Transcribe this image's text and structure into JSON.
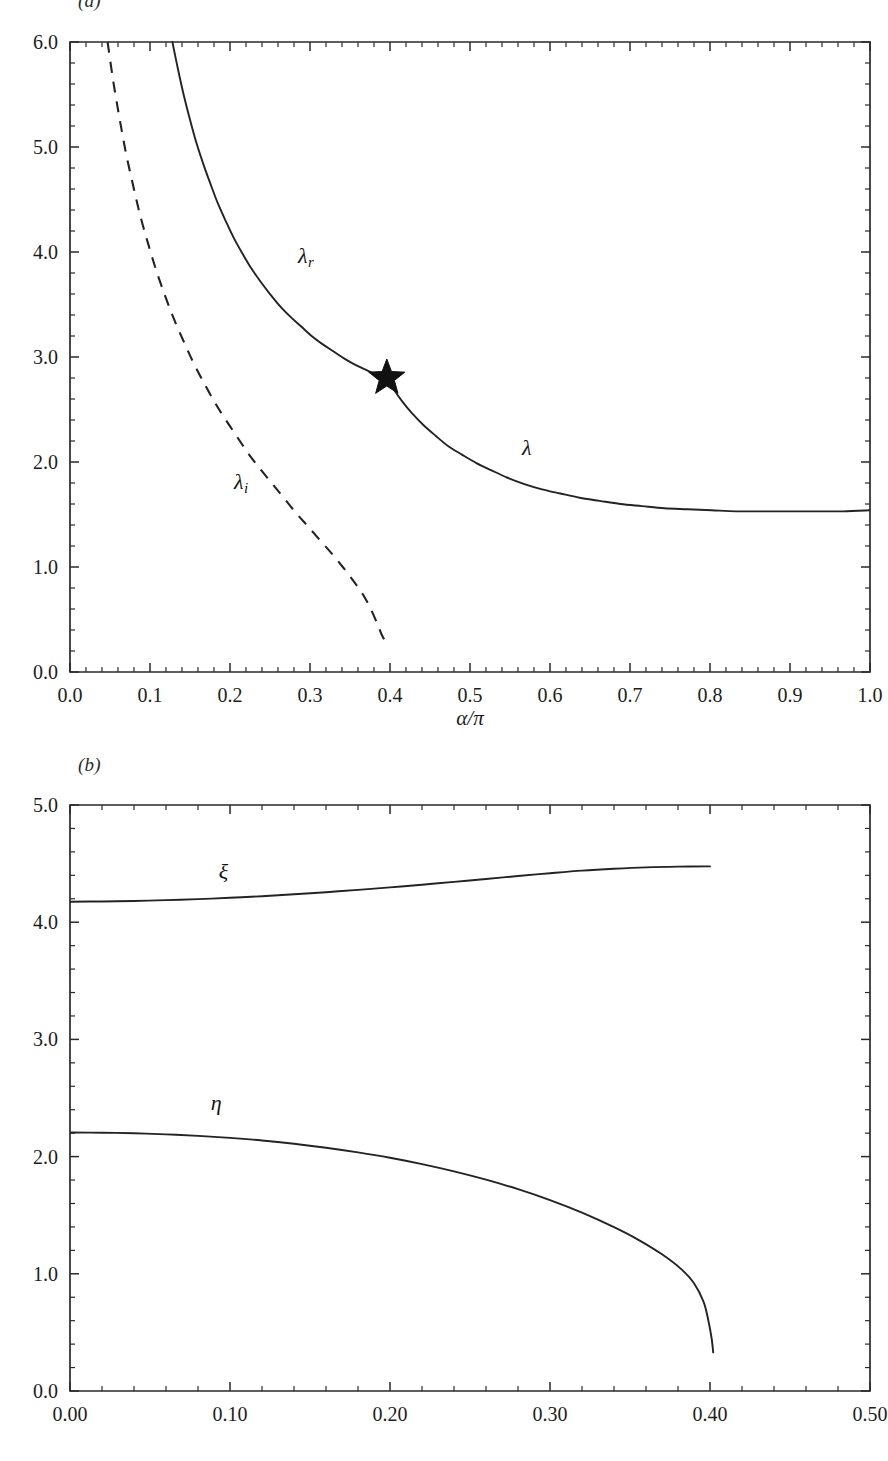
{
  "figure": {
    "panel_a_tag": "(a)",
    "panel_b_tag": "(b)"
  },
  "chart_data": [
    {
      "id": "panel-a",
      "type": "line",
      "title": "",
      "panel_label": "(a)",
      "xlabel": "α/π",
      "ylabel": "",
      "xlim": [
        0.0,
        1.0
      ],
      "ylim": [
        0.0,
        6.0
      ],
      "xticks": [
        0.0,
        0.1,
        0.2,
        0.3,
        0.4,
        0.5,
        0.6,
        0.7,
        0.8,
        0.9,
        1.0
      ],
      "xtick_labels": [
        "0.0",
        "0.1",
        "0.2",
        "0.3",
        "0.4",
        "0.5",
        "0.6",
        "0.7",
        "0.8",
        "0.9",
        "1.0"
      ],
      "yticks": [
        0.0,
        1.0,
        2.0,
        3.0,
        4.0,
        5.0,
        6.0
      ],
      "ytick_labels": [
        "0.0",
        "1.0",
        "2.0",
        "3.0",
        "4.0",
        "5.0",
        "6.0"
      ],
      "x_minor_step": 0.02,
      "y_minor_step": 0.2,
      "grid": false,
      "legend": "inline-curve-labels",
      "annotations": [
        {
          "name": "lambda-r-label",
          "text": "λ",
          "sub": "r",
          "x": 0.285,
          "y": 3.95
        },
        {
          "name": "lambda-i-label",
          "text": "λ",
          "sub": "i",
          "x": 0.205,
          "y": 1.8
        },
        {
          "name": "lambda-label",
          "text": "λ",
          "sub": "",
          "x": 0.565,
          "y": 2.12
        }
      ],
      "markers": [
        {
          "name": "bifurcation-star",
          "symbol": "star",
          "x": 0.396,
          "y": 2.8,
          "size": 19,
          "color": "#111111"
        }
      ],
      "series": [
        {
          "name": "λ_r",
          "style": "solid",
          "points": [
            [
              0.128,
              6.0
            ],
            [
              0.135,
              5.74
            ],
            [
              0.142,
              5.5
            ],
            [
              0.15,
              5.26
            ],
            [
              0.158,
              5.04
            ],
            [
              0.167,
              4.83
            ],
            [
              0.176,
              4.64
            ],
            [
              0.185,
              4.46
            ],
            [
              0.195,
              4.29
            ],
            [
              0.205,
              4.13
            ],
            [
              0.216,
              3.98
            ],
            [
              0.227,
              3.84
            ],
            [
              0.239,
              3.71
            ],
            [
              0.251,
              3.59
            ],
            [
              0.263,
              3.48
            ],
            [
              0.276,
              3.38
            ],
            [
              0.289,
              3.29
            ],
            [
              0.302,
              3.2
            ],
            [
              0.316,
              3.12
            ],
            [
              0.33,
              3.05
            ],
            [
              0.344,
              2.98
            ],
            [
              0.358,
              2.92
            ],
            [
              0.372,
              2.87
            ],
            [
              0.384,
              2.83
            ],
            [
              0.396,
              2.8
            ]
          ]
        },
        {
          "name": "λ",
          "style": "solid",
          "points": [
            [
              0.396,
              2.8
            ],
            [
              0.404,
              2.7
            ],
            [
              0.415,
              2.58
            ],
            [
              0.428,
              2.46
            ],
            [
              0.442,
              2.35
            ],
            [
              0.457,
              2.25
            ],
            [
              0.473,
              2.15
            ],
            [
              0.49,
              2.07
            ],
            [
              0.508,
              1.99
            ],
            [
              0.527,
              1.92
            ],
            [
              0.547,
              1.85
            ],
            [
              0.568,
              1.79
            ],
            [
              0.59,
              1.74
            ],
            [
              0.613,
              1.7
            ],
            [
              0.637,
              1.66
            ],
            [
              0.662,
              1.63
            ],
            [
              0.688,
              1.6
            ],
            [
              0.715,
              1.58
            ],
            [
              0.743,
              1.56
            ],
            [
              0.772,
              1.55
            ],
            [
              0.802,
              1.54
            ],
            [
              0.833,
              1.53
            ],
            [
              0.865,
              1.53
            ],
            [
              0.898,
              1.53
            ],
            [
              0.932,
              1.53
            ],
            [
              0.966,
              1.53
            ],
            [
              1.0,
              1.54
            ]
          ]
        },
        {
          "name": "λ_i",
          "style": "dashed",
          "points": [
            [
              0.047,
              6.0
            ],
            [
              0.054,
              5.63
            ],
            [
              0.062,
              5.27
            ],
            [
              0.07,
              4.94
            ],
            [
              0.079,
              4.63
            ],
            [
              0.088,
              4.34
            ],
            [
              0.098,
              4.07
            ],
            [
              0.108,
              3.82
            ],
            [
              0.119,
              3.58
            ],
            [
              0.13,
              3.36
            ],
            [
              0.142,
              3.15
            ],
            [
              0.154,
              2.95
            ],
            [
              0.167,
              2.76
            ],
            [
              0.18,
              2.58
            ],
            [
              0.194,
              2.41
            ],
            [
              0.208,
              2.25
            ],
            [
              0.222,
              2.09
            ],
            [
              0.237,
              1.94
            ],
            [
              0.252,
              1.8
            ],
            [
              0.267,
              1.66
            ],
            [
              0.282,
              1.52
            ],
            [
              0.297,
              1.39
            ],
            [
              0.312,
              1.26
            ],
            [
              0.327,
              1.13
            ],
            [
              0.341,
              1.0
            ],
            [
              0.354,
              0.87
            ],
            [
              0.366,
              0.74
            ],
            [
              0.376,
              0.6
            ],
            [
              0.384,
              0.46
            ],
            [
              0.39,
              0.35
            ],
            [
              0.395,
              0.28
            ]
          ]
        }
      ]
    },
    {
      "id": "panel-b",
      "type": "line",
      "title": "",
      "panel_label": "(b)",
      "xlabel": "",
      "ylabel": "",
      "xlim": [
        0.0,
        0.5
      ],
      "ylim": [
        0.0,
        5.0
      ],
      "xticks": [
        0.0,
        0.1,
        0.2,
        0.3,
        0.4,
        0.5
      ],
      "xtick_labels": [
        "0.00",
        "0.10",
        "0.20",
        "0.30",
        "0.40",
        "0.50"
      ],
      "yticks": [
        0.0,
        1.0,
        2.0,
        3.0,
        4.0,
        5.0
      ],
      "ytick_labels": [
        "0.0",
        "1.0",
        "2.0",
        "3.0",
        "4.0",
        "5.0"
      ],
      "x_minor_step": 0.02,
      "y_minor_step": 0.2,
      "grid": false,
      "legend": "inline-curve-labels",
      "annotations": [
        {
          "name": "xi-label",
          "text": "ξ",
          "sub": "",
          "x": 0.093,
          "y": 4.42
        },
        {
          "name": "eta-label",
          "text": "η",
          "sub": "",
          "x": 0.088,
          "y": 2.45
        }
      ],
      "markers": [],
      "series": [
        {
          "name": "ξ",
          "style": "solid",
          "points": [
            [
              0.0,
              4.175
            ],
            [
              0.02,
              4.177
            ],
            [
              0.04,
              4.181
            ],
            [
              0.06,
              4.188
            ],
            [
              0.08,
              4.197
            ],
            [
              0.1,
              4.208
            ],
            [
              0.12,
              4.222
            ],
            [
              0.14,
              4.238
            ],
            [
              0.16,
              4.256
            ],
            [
              0.18,
              4.276
            ],
            [
              0.2,
              4.297
            ],
            [
              0.22,
              4.32
            ],
            [
              0.24,
              4.344
            ],
            [
              0.26,
              4.369
            ],
            [
              0.28,
              4.394
            ],
            [
              0.3,
              4.418
            ],
            [
              0.32,
              4.44
            ],
            [
              0.34,
              4.456
            ],
            [
              0.36,
              4.468
            ],
            [
              0.38,
              4.474
            ],
            [
              0.4,
              4.476
            ]
          ]
        },
        {
          "name": "η",
          "style": "solid",
          "points": [
            [
              0.0,
              2.205
            ],
            [
              0.02,
              2.204
            ],
            [
              0.04,
              2.199
            ],
            [
              0.06,
              2.19
            ],
            [
              0.08,
              2.177
            ],
            [
              0.1,
              2.16
            ],
            [
              0.12,
              2.138
            ],
            [
              0.14,
              2.11
            ],
            [
              0.16,
              2.076
            ],
            [
              0.18,
              2.036
            ],
            [
              0.2,
              1.99
            ],
            [
              0.22,
              1.936
            ],
            [
              0.24,
              1.874
            ],
            [
              0.26,
              1.803
            ],
            [
              0.28,
              1.722
            ],
            [
              0.3,
              1.629
            ],
            [
              0.32,
              1.522
            ],
            [
              0.34,
              1.398
            ],
            [
              0.355,
              1.292
            ],
            [
              0.37,
              1.166
            ],
            [
              0.382,
              1.04
            ],
            [
              0.39,
              0.92
            ],
            [
              0.396,
              0.76
            ],
            [
              0.399,
              0.6
            ],
            [
              0.401,
              0.45
            ],
            [
              0.402,
              0.33
            ]
          ]
        }
      ]
    }
  ]
}
